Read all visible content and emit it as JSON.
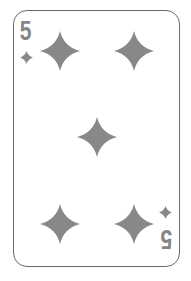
{
  "card": {
    "rank": "5",
    "suit": "diamonds",
    "suit_icon": "diamond-icon",
    "pip_count": 5,
    "colors": {
      "pip": "#888888",
      "rank": "#858585",
      "border": "#6a6a6a",
      "background": "#ffffff"
    }
  }
}
